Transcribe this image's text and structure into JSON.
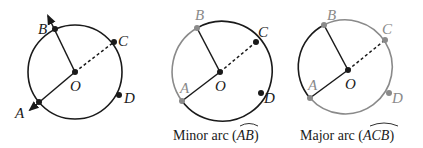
{
  "colors": {
    "dark": "#1a1a1a",
    "highlight": "#8a8a8a",
    "background": "#ffffff"
  },
  "figures": [
    {
      "id": "circle-1",
      "caption": "",
      "points": {
        "A": "A",
        "B": "B",
        "C": "C",
        "D": "D",
        "O": "O"
      },
      "highlighted_arc": "none"
    },
    {
      "id": "circle-2",
      "caption_prefix": "Minor arc (",
      "caption_arc": "AB",
      "caption_suffix": ")",
      "points": {
        "A": "A",
        "B": "B",
        "C": "C",
        "D": "D",
        "O": "O"
      },
      "highlighted_arc": "AB"
    },
    {
      "id": "circle-3",
      "caption_prefix": "Major arc (",
      "caption_arc": "ACB",
      "caption_suffix": ")",
      "points": {
        "A": "A",
        "B": "B",
        "C": "C",
        "D": "D",
        "O": "O"
      },
      "highlighted_arc": "ACB"
    }
  ]
}
